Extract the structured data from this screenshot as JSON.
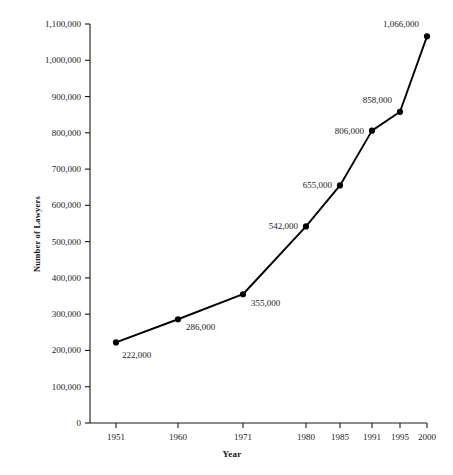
{
  "chart_data": {
    "type": "line",
    "title": "",
    "xlabel": "Year",
    "ylabel": "Number of Lawyers",
    "x": [
      1951,
      1960,
      1971,
      1980,
      1985,
      1991,
      1995,
      2000
    ],
    "values": [
      222000,
      286000,
      355000,
      542000,
      655000,
      806000,
      858000,
      1066000
    ],
    "point_labels": [
      "222,000",
      "286,000",
      "355,000",
      "542,000",
      "655,000",
      "806,000",
      "858,000",
      "1,066,000"
    ],
    "xtick_labels": [
      "1951",
      "1960",
      "1971",
      "1980",
      "1985",
      "1991",
      "1995",
      "2000"
    ],
    "ytick_values": [
      0,
      100000,
      200000,
      300000,
      400000,
      500000,
      600000,
      700000,
      800000,
      900000,
      1000000,
      1100000
    ],
    "ytick_labels": [
      "0",
      "100,000",
      "200,000",
      "300,000",
      "400,000",
      "500,000",
      "600,000",
      "700,000",
      "800,000",
      "900,000",
      "1,000,000",
      "1,100,000"
    ],
    "xlim": [
      1951,
      2000
    ],
    "ylim": [
      0,
      1100000
    ],
    "grid": false,
    "legend": "none",
    "series_color": "#000000",
    "marker": "circle",
    "marker_color": "#000000"
  },
  "layout": {
    "plot_left": 90,
    "plot_right": 427,
    "plot_top": 24,
    "plot_bottom": 423,
    "x_positions": [
      116,
      178,
      243,
      306,
      340,
      372,
      400,
      427
    ],
    "label_offsets": [
      {
        "dx": 6,
        "dy": 13,
        "anchor": "start"
      },
      {
        "dx": 8,
        "dy": 8,
        "anchor": "start"
      },
      {
        "dx": 8,
        "dy": 9,
        "anchor": "start"
      },
      {
        "dx": -8,
        "dy": 0,
        "anchor": "end"
      },
      {
        "dx": -8,
        "dy": 0,
        "anchor": "end"
      },
      {
        "dx": -8,
        "dy": 0,
        "anchor": "end"
      },
      {
        "dx": -8,
        "dy": -12,
        "anchor": "end"
      },
      {
        "dx": -8,
        "dy": -12,
        "anchor": "end"
      }
    ],
    "y_axis_title_pos": {
      "x": 32,
      "y": 272
    },
    "x_axis_title_pos": {
      "x": 232,
      "y": 454
    }
  }
}
